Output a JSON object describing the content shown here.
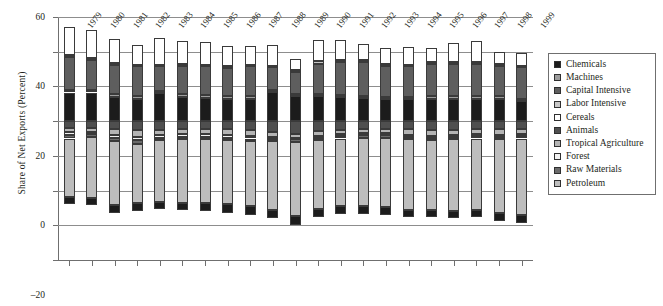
{
  "chart_data": {
    "type": "bar",
    "subtype": "stacked-bar-diverging",
    "title": "",
    "xlabel": "",
    "ylabel": "Share of Net Exports (Percent)",
    "ylim": [
      -80,
      60
    ],
    "yticks": [
      60,
      40,
      20,
      0,
      -20,
      -40,
      -60,
      -80
    ],
    "ytick_labels": [
      "60",
      "40",
      "20",
      "0",
      "–20",
      "–40",
      "–60",
      "–80"
    ],
    "grid": true,
    "legend_position": "right",
    "categories": [
      "1979",
      "1980",
      "1981",
      "1982",
      "1983",
      "1984",
      "1985",
      "1986",
      "1987",
      "1988",
      "1989",
      "1990",
      "1991",
      "1992",
      "1993",
      "1994",
      "1995",
      "1996",
      "1997",
      "1998",
      "1999"
    ],
    "series": [
      {
        "name": "Chemicals",
        "color": "#1c1c1c",
        "sign": "positive",
        "values": [
          16.5,
          16.5,
          14.0,
          13.0,
          16.0,
          14.0,
          13.5,
          13.0,
          13.0,
          17.0,
          14.5,
          14.5,
          14.0,
          13.5,
          13.0,
          12.5,
          13.0,
          13.0,
          13.0,
          13.0,
          11.5
        ]
      },
      {
        "name": "Machines",
        "color": "#9c9c9c",
        "sign": "positive",
        "values": [
          1.5,
          1.5,
          1.5,
          1.5,
          1.5,
          1.5,
          1.5,
          1.5,
          1.5,
          1.0,
          1.0,
          1.0,
          1.0,
          1.0,
          1.0,
          1.5,
          1.5,
          1.5,
          1.5,
          1.5,
          1.5
        ]
      },
      {
        "name": "Capital Intensive",
        "color": "#5e5e5e",
        "sign": "positive",
        "values": [
          19.0,
          17.5,
          17.0,
          17.0,
          14.0,
          16.5,
          16.5,
          16.0,
          17.0,
          13.0,
          13.0,
          17.5,
          19.0,
          19.5,
          18.0,
          17.5,
          18.5,
          18.5,
          18.5,
          17.5,
          18.0
        ]
      },
      {
        "name": "Labor Intensive",
        "color": "#c6c6c6",
        "sign": "positive",
        "values": [
          1.0,
          1.0,
          1.0,
          1.0,
          1.0,
          1.0,
          1.0,
          1.0,
          1.0,
          1.0,
          1.0,
          1.5,
          1.0,
          1.0,
          1.0,
          1.0,
          1.0,
          1.0,
          1.0,
          1.0,
          1.0
        ]
      },
      {
        "name": "Cereals",
        "color": "#ffffff",
        "sign": "positive",
        "values": [
          16.0,
          16.0,
          14.0,
          11.5,
          15.5,
          13.0,
          13.0,
          12.0,
          11.0,
          12.0,
          6.5,
          12.5,
          12.0,
          9.5,
          9.0,
          10.0,
          8.0,
          11.0,
          12.0,
          7.0,
          7.0
        ]
      },
      {
        "name": "Animals",
        "color": "#4f4f4f",
        "sign": "negative",
        "values": [
          4.0,
          4.0,
          4.5,
          5.0,
          5.0,
          4.5,
          4.5,
          4.5,
          5.0,
          6.5,
          7.5,
          5.5,
          5.0,
          4.5,
          4.5,
          4.5,
          5.0,
          5.0,
          4.5,
          4.5,
          4.5
        ]
      },
      {
        "name": "Tropical Agriculture",
        "color": "#b4b4b4",
        "sign": "negative",
        "values": [
          2.5,
          2.0,
          3.5,
          4.0,
          3.0,
          3.0,
          3.0,
          3.5,
          3.5,
          2.5,
          2.0,
          3.0,
          2.5,
          2.5,
          2.5,
          3.5,
          3.5,
          3.0,
          3.0,
          3.5,
          3.0
        ]
      },
      {
        "name": "Forest",
        "color": "#f2f2f2",
        "sign": "negative",
        "values": [
          1.5,
          1.5,
          1.5,
          2.0,
          1.5,
          1.5,
          1.5,
          1.5,
          1.5,
          1.0,
          1.0,
          1.0,
          1.0,
          1.0,
          1.0,
          1.0,
          1.0,
          1.0,
          1.0,
          1.0,
          1.0
        ]
      },
      {
        "name": "Raw Materials",
        "color": "#6b6b6b",
        "sign": "negative",
        "values": [
          2.0,
          1.5,
          2.0,
          2.0,
          1.5,
          1.5,
          1.5,
          1.5,
          1.5,
          1.5,
          1.5,
          1.5,
          1.5,
          1.5,
          1.5,
          1.5,
          1.5,
          1.5,
          1.5,
          1.5,
          1.5
        ]
      },
      {
        "name": "Petroleum",
        "color": "#bdbdbd",
        "sign": "negative",
        "values": [
          33.5,
          35.5,
          37.0,
          34.0,
          35.5,
          36.5,
          36.5,
          37.0,
          37.5,
          39.5,
          42.5,
          39.5,
          39.0,
          39.5,
          40.0,
          40.5,
          40.0,
          41.0,
          41.0,
          42.5,
          44.0
        ]
      },
      {
        "name": "Chemicals (net import)",
        "color": "#1c1c1c",
        "sign": "negative",
        "values": [
          4.0,
          4.0,
          4.5,
          5.0,
          4.0,
          4.0,
          4.5,
          5.0,
          5.0,
          5.0,
          5.5,
          4.5,
          4.5,
          4.5,
          4.5,
          4.5,
          4.5,
          4.5,
          4.5,
          4.5,
          4.5
        ]
      }
    ],
    "legend_entries": [
      {
        "label": "Chemicals",
        "color": "#1c1c1c"
      },
      {
        "label": "Machines",
        "color": "#9c9c9c"
      },
      {
        "label": "Capital Intensive",
        "color": "#5e5e5e"
      },
      {
        "label": "Labor Intensive",
        "color": "#c6c6c6"
      },
      {
        "label": "Cereals",
        "color": "#ffffff"
      },
      {
        "label": "Animals",
        "color": "#4f4f4f"
      },
      {
        "label": "Tropical Agriculture",
        "color": "#b4b4b4"
      },
      {
        "label": "Forest",
        "color": "#f2f2f2"
      },
      {
        "label": "Raw Materials",
        "color": "#6b6b6b"
      },
      {
        "label": "Petroleum",
        "color": "#bdbdbd"
      }
    ]
  }
}
